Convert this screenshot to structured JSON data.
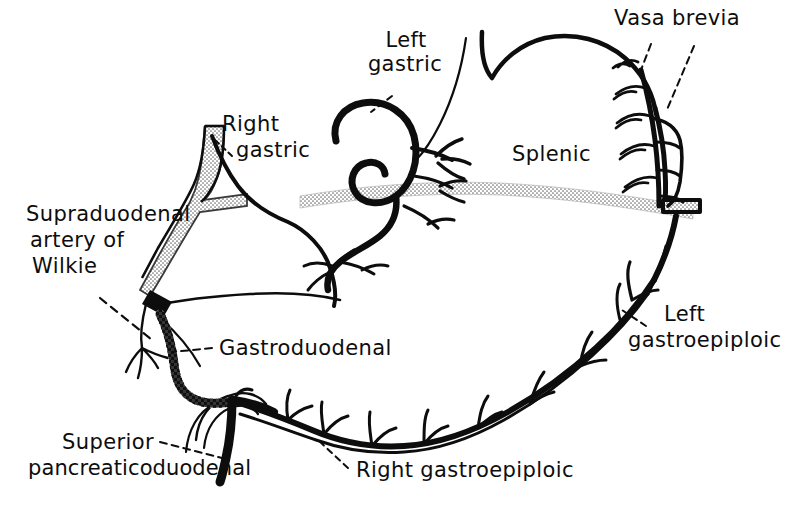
{
  "figure": {
    "background_color": "#ffffff",
    "ink_color": "#0d0d0d",
    "stipple_color": "#8c8c8c",
    "width": 804,
    "height": 515
  },
  "labels": {
    "vasa_brevia": "Vasa brevia",
    "left_gastric_line1": "Left",
    "left_gastric_line2": "gastric",
    "right_gastric_line1": "Right",
    "right_gastric_line2": "gastric",
    "splenic": "Splenic",
    "supraduodenal_line1": "Supraduodenal",
    "supraduodenal_line2": "artery of",
    "supraduodenal_line3": "Wilkie",
    "gastroduodenal": "Gastroduodenal",
    "left_gastroepiploic_line1": "Left",
    "left_gastroepiploic_line2": "gastroepiploic",
    "right_gastroepiploic": "Right gastroepiploic",
    "superior_pd_line1": "Superior",
    "superior_pd_line2": "pancreaticoduodenal"
  },
  "vessels": [
    {
      "name": "left-gastric-artery",
      "style": "solid-black",
      "label": "Left gastric"
    },
    {
      "name": "right-gastric-artery",
      "style": "stippled",
      "label": "Right gastric"
    },
    {
      "name": "splenic-artery",
      "style": "stippled",
      "label": "Splenic"
    },
    {
      "name": "vasa-brevia",
      "style": "solid-black",
      "label": "Vasa brevia"
    },
    {
      "name": "supraduodenal-artery-of-wilkie",
      "style": "solid-black",
      "label": "Supraduodenal artery of Wilkie"
    },
    {
      "name": "gastroduodenal-artery",
      "style": "checkered",
      "label": "Gastroduodenal"
    },
    {
      "name": "left-gastroepiploic-artery",
      "style": "solid-black",
      "label": "Left gastroepiploic"
    },
    {
      "name": "right-gastroepiploic-artery",
      "style": "solid-black",
      "label": "Right gastroepiploic"
    },
    {
      "name": "superior-pancreaticoduodenal-artery",
      "style": "solid-black",
      "label": "Superior pancreaticoduodenal"
    }
  ]
}
